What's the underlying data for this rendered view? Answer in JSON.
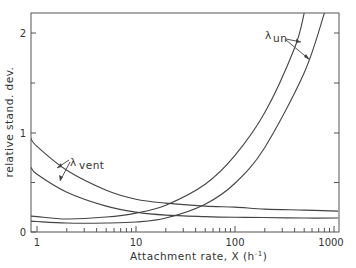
{
  "chart_data": {
    "type": "line",
    "title": "",
    "xlabel": "Attachment rate, X (h⁻¹)",
    "ylabel": "relative stand. dev.",
    "xscale": "log",
    "xlim": [
      0.87,
      1100
    ],
    "ylim": [
      0,
      2.2
    ],
    "xticks": [
      "1",
      "10",
      "100",
      "1000"
    ],
    "yticks": [
      "0",
      "1",
      "2"
    ],
    "grid": false,
    "annotations": [
      {
        "text": "λ",
        "sub": "vent",
        "points_to": [
          "vent_upper",
          "vent_lower"
        ]
      },
      {
        "text": "λ",
        "sub": "un",
        "points_to": [
          "un_upper",
          "un_lower"
        ]
      }
    ],
    "series": [
      {
        "name": "vent_upper",
        "x": [
          0.87,
          1,
          2,
          5,
          10,
          20,
          50,
          100,
          200,
          500,
          1100
        ],
        "y": [
          0.94,
          0.86,
          0.62,
          0.42,
          0.33,
          0.29,
          0.26,
          0.25,
          0.23,
          0.22,
          0.21
        ]
      },
      {
        "name": "vent_lower",
        "x": [
          0.87,
          1,
          2,
          5,
          10,
          20,
          50,
          100,
          200,
          500,
          1100
        ],
        "y": [
          0.65,
          0.58,
          0.4,
          0.26,
          0.2,
          0.17,
          0.155,
          0.148,
          0.145,
          0.14,
          0.14
        ]
      },
      {
        "name": "un_upper",
        "x": [
          0.87,
          1,
          2,
          5,
          10,
          20,
          50,
          100,
          200,
          400,
          500
        ],
        "y": [
          0.16,
          0.155,
          0.13,
          0.15,
          0.19,
          0.27,
          0.48,
          0.77,
          1.2,
          1.85,
          2.2
        ]
      },
      {
        "name": "un_lower",
        "x": [
          0.87,
          1,
          2,
          5,
          10,
          20,
          50,
          100,
          200,
          500,
          800
        ],
        "y": [
          0.11,
          0.105,
          0.09,
          0.09,
          0.1,
          0.14,
          0.28,
          0.49,
          0.85,
          1.6,
          2.2
        ]
      }
    ]
  },
  "labels": {
    "ylabel": "relative stand. dev.",
    "xlabel_main": "Attachment rate, X (h",
    "xlabel_sup": "-1",
    "xlabel_end": ")",
    "lambda": "λ",
    "vent_sub": "vent",
    "un_sub": "un",
    "xtick_1": "1",
    "xtick_10": "10",
    "xtick_100": "100",
    "xtick_1000": "1000",
    "ytick_0": "0",
    "ytick_1": "1",
    "ytick_2": "2"
  }
}
